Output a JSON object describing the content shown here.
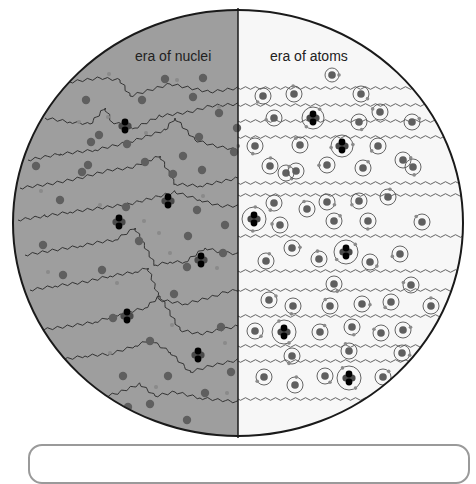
{
  "diagram": {
    "title_left": "era of nuclei",
    "title_right": "era of atoms",
    "colors": {
      "left_background": "#9e9e9e",
      "right_background": "#f7f7f7",
      "outline": "#1a1a1a",
      "nucleus": "#5f5f5f",
      "electron": "#8a8a8a",
      "helium_proton": "#000000",
      "helium_neutron": "#4a4a4a",
      "photon_left": "#333333",
      "photon_right": "#555555",
      "caption_border": "#9a9a9a"
    },
    "circle": {
      "cx": 238,
      "cy": 223,
      "rx": 225,
      "ry": 213
    },
    "divider_x": 238
  },
  "left_half": {
    "free_nuclei": [
      [
        165,
        79
      ],
      [
        203,
        78
      ],
      [
        86,
        100
      ],
      [
        142,
        100
      ],
      [
        193,
        97
      ],
      [
        219,
        113
      ],
      [
        99,
        135
      ],
      [
        199,
        137
      ],
      [
        237,
        128
      ],
      [
        91,
        142
      ],
      [
        127,
        144
      ],
      [
        145,
        162
      ],
      [
        183,
        156
      ],
      [
        88,
        165
      ],
      [
        234,
        152
      ],
      [
        36,
        166
      ],
      [
        82,
        172
      ],
      [
        173,
        174
      ],
      [
        202,
        170
      ],
      [
        60,
        200
      ],
      [
        197,
        210
      ],
      [
        126,
        207
      ],
      [
        139,
        241
      ],
      [
        188,
        236
      ],
      [
        225,
        225
      ],
      [
        43,
        245
      ],
      [
        102,
        270
      ],
      [
        187,
        267
      ],
      [
        63,
        275
      ],
      [
        223,
        253
      ],
      [
        174,
        294
      ],
      [
        113,
        318
      ],
      [
        150,
        341
      ],
      [
        221,
        327
      ],
      [
        55,
        355
      ],
      [
        123,
        376
      ],
      [
        168,
        376
      ],
      [
        231,
        372
      ],
      [
        205,
        393
      ],
      [
        78,
        398
      ],
      [
        128,
        407
      ],
      [
        150,
        404
      ],
      [
        187,
        420
      ]
    ],
    "free_electrons": [
      [
        109,
        74
      ],
      [
        146,
        133
      ],
      [
        219,
        107
      ],
      [
        177,
        80
      ],
      [
        108,
        117
      ],
      [
        79,
        122
      ],
      [
        41,
        191
      ],
      [
        100,
        205
      ],
      [
        144,
        221
      ],
      [
        203,
        196
      ],
      [
        238,
        146
      ],
      [
        170,
        253
      ],
      [
        217,
        268
      ],
      [
        159,
        233
      ],
      [
        117,
        283
      ],
      [
        48,
        272
      ],
      [
        172,
        325
      ],
      [
        225,
        343
      ],
      [
        110,
        353
      ],
      [
        227,
        393
      ],
      [
        98,
        430
      ],
      [
        156,
        387
      ]
    ],
    "helium_nuclei": [
      [
        125,
        126
      ],
      [
        168,
        201
      ],
      [
        119,
        222
      ],
      [
        201,
        260
      ],
      [
        127,
        316
      ],
      [
        198,
        355
      ]
    ],
    "photon_paths": [
      "M70,82 Q100,78 120,80 L130,96 Q150,90 170,84 L190,88 Q210,92 238,88",
      "M45,118 Q70,122 90,124 L105,108 L112,122 Q135,128 160,116 L190,112 Q210,106 238,104",
      "M28,160 Q60,154 95,150 Q130,142 165,130 L175,118 L195,140 Q215,146 238,150",
      "M20,188 Q50,184 80,178 Q110,170 130,168 L160,156 L175,184 Q200,186 238,178",
      "M18,220 Q45,216 70,212 Q100,208 130,204 L175,192 L200,200 Q220,206 238,206",
      "M25,255 Q55,250 80,246 Q100,242 115,240 L135,228 L155,265 Q170,262 185,262 L205,248 Q220,252 238,254",
      "M30,290 Q55,286 85,282 Q110,276 135,272 L148,268 L160,300 Q185,304 215,296 Q225,292 238,290",
      "M40,330 Q70,326 95,322 Q120,314 145,308 L160,296 L180,330 Q200,334 238,326",
      "M60,360 Q85,356 110,354 Q135,346 150,340 L170,352 L190,372 Q210,366 238,360",
      "M95,398 Q115,394 140,384 L155,396 L175,392 Q200,398 238,402"
    ]
  },
  "right_half": {
    "atoms": [
      [
        332,
        75,
        7
      ],
      [
        263,
        96,
        8
      ],
      [
        294,
        94,
        8
      ],
      [
        361,
        94,
        8
      ],
      [
        274,
        118,
        8
      ],
      [
        313,
        118,
        11,
        true
      ],
      [
        359,
        122,
        8
      ],
      [
        380,
        112,
        8
      ],
      [
        412,
        122,
        8
      ],
      [
        255,
        146,
        8
      ],
      [
        300,
        145,
        8
      ],
      [
        342,
        146,
        11,
        true
      ],
      [
        378,
        146,
        8
      ],
      [
        270,
        166,
        8
      ],
      [
        286,
        173,
        8
      ],
      [
        327,
        165,
        8
      ],
      [
        363,
        168,
        8
      ],
      [
        413,
        167,
        8
      ],
      [
        296,
        171,
        8
      ],
      [
        403,
        160,
        8
      ],
      [
        274,
        203,
        8
      ],
      [
        307,
        209,
        8
      ],
      [
        327,
        202,
        8
      ],
      [
        359,
        201,
        8
      ],
      [
        388,
        197,
        8
      ],
      [
        254,
        219,
        12,
        true
      ],
      [
        280,
        225,
        8
      ],
      [
        334,
        221,
        8
      ],
      [
        368,
        221,
        8
      ],
      [
        422,
        222,
        8
      ],
      [
        292,
        248,
        8
      ],
      [
        346,
        252,
        12,
        true
      ],
      [
        319,
        259,
        8
      ],
      [
        370,
        262,
        8
      ],
      [
        400,
        254,
        8
      ],
      [
        266,
        261,
        8
      ],
      [
        334,
        284,
        8
      ],
      [
        411,
        285,
        8
      ],
      [
        269,
        300,
        8
      ],
      [
        293,
        306,
        8
      ],
      [
        330,
        306,
        8
      ],
      [
        362,
        304,
        8
      ],
      [
        391,
        302,
        8
      ],
      [
        431,
        306,
        8
      ],
      [
        255,
        331,
        8
      ],
      [
        284,
        332,
        12,
        true
      ],
      [
        320,
        332,
        8
      ],
      [
        352,
        327,
        8
      ],
      [
        381,
        333,
        8
      ],
      [
        403,
        330,
        8
      ],
      [
        292,
        356,
        8
      ],
      [
        349,
        351,
        8
      ],
      [
        402,
        353,
        8
      ],
      [
        264,
        377,
        8
      ],
      [
        295,
        385,
        8
      ],
      [
        325,
        376,
        8
      ],
      [
        349,
        378,
        12,
        true
      ],
      [
        383,
        377,
        8
      ],
      [
        415,
        374,
        8
      ]
    ],
    "photon_rows": [
      88,
      105,
      121,
      137,
      183,
      195,
      236,
      271,
      290,
      316,
      346,
      361,
      399
    ]
  }
}
